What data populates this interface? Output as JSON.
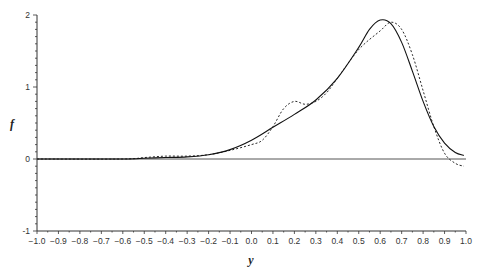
{
  "chart_data": {
    "type": "line",
    "title": "",
    "xlabel": "y",
    "ylabel": "f",
    "xlim": [
      -1.0,
      1.0
    ],
    "ylim": [
      -1,
      2
    ],
    "xticks": [
      "-1.0",
      "-0.9",
      "-0.8",
      "-0.7",
      "-0.6",
      "-0.5",
      "-0.4",
      "-0.3",
      "-0.2",
      "-0.1",
      "0.0",
      "0.1",
      "0.2",
      "0.3",
      "0.4",
      "0.5",
      "0.6",
      "0.7",
      "0.8",
      "0.9",
      "1.0"
    ],
    "yticks": [
      "-1",
      "0",
      "1",
      "2"
    ],
    "y_minor_tick_step": 0.1,
    "grid": false,
    "legend": null,
    "reference_line": {
      "y": 0
    },
    "series": [
      {
        "name": "solid",
        "style": "solid",
        "x": [
          -1.0,
          -0.6,
          -0.5,
          -0.4,
          -0.3,
          -0.2,
          -0.1,
          0.0,
          0.1,
          0.2,
          0.3,
          0.4,
          0.5,
          0.55,
          0.6,
          0.65,
          0.7,
          0.75,
          0.8,
          0.85,
          0.9,
          0.95,
          0.99
        ],
        "values": [
          0.0,
          0.0,
          0.01,
          0.02,
          0.03,
          0.06,
          0.13,
          0.26,
          0.44,
          0.62,
          0.82,
          1.12,
          1.55,
          1.8,
          1.93,
          1.88,
          1.62,
          1.22,
          0.8,
          0.45,
          0.22,
          0.09,
          0.05
        ]
      },
      {
        "name": "dashed",
        "style": "dashed",
        "x": [
          -1.0,
          -0.6,
          -0.5,
          -0.4,
          -0.3,
          -0.2,
          -0.1,
          0.0,
          0.05,
          0.1,
          0.15,
          0.2,
          0.25,
          0.3,
          0.35,
          0.4,
          0.5,
          0.6,
          0.65,
          0.7,
          0.75,
          0.8,
          0.85,
          0.9,
          0.95,
          0.99
        ],
        "values": [
          0.0,
          0.0,
          0.02,
          0.04,
          0.04,
          0.06,
          0.12,
          0.2,
          0.26,
          0.45,
          0.7,
          0.8,
          0.76,
          0.8,
          0.92,
          1.12,
          1.52,
          1.78,
          1.9,
          1.8,
          1.45,
          0.95,
          0.45,
          0.08,
          -0.06,
          -0.1
        ]
      }
    ]
  }
}
